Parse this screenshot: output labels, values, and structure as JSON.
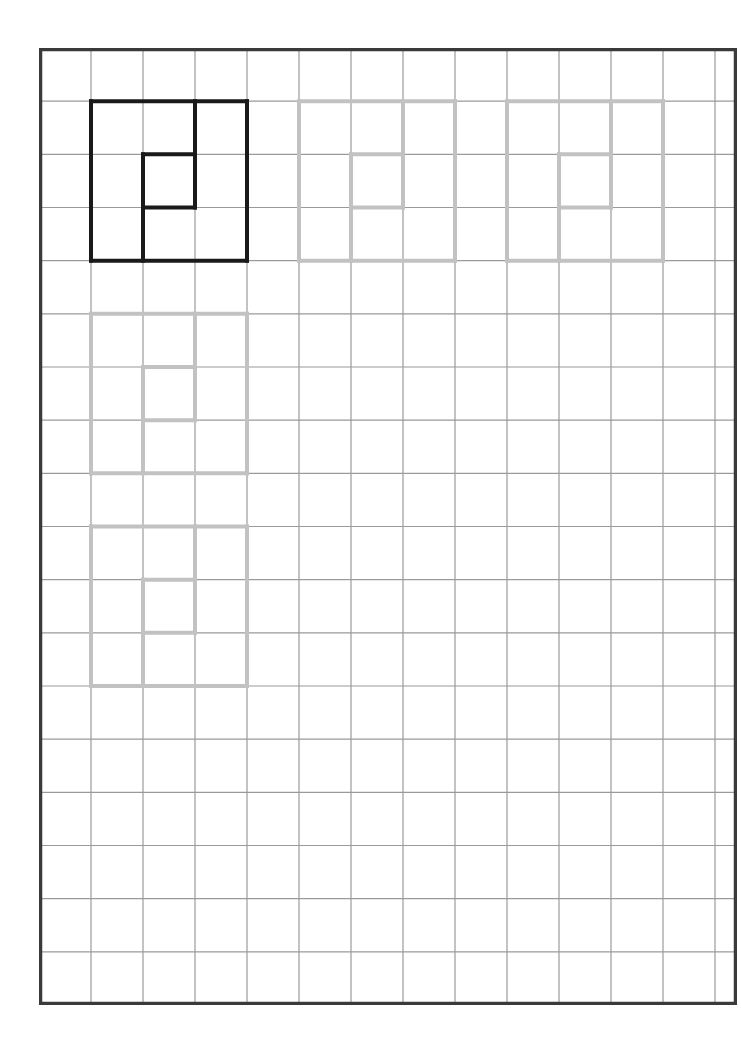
{
  "worksheet": {
    "type": "copy-the-pattern grid exercise",
    "grid": {
      "columns": 14,
      "rows": 18,
      "cell_width": 52,
      "cell_height": 53,
      "line_color": "#9a9a9a",
      "border_color": "#3a3a3a"
    },
    "pattern_segments": [
      {
        "from": [
          0,
          0
        ],
        "to": [
          3,
          0
        ]
      },
      {
        "from": [
          3,
          0
        ],
        "to": [
          3,
          3
        ]
      },
      {
        "from": [
          3,
          3
        ],
        "to": [
          0,
          3
        ]
      },
      {
        "from": [
          0,
          3
        ],
        "to": [
          0,
          0
        ]
      },
      {
        "from": [
          2,
          0
        ],
        "to": [
          2,
          2
        ]
      },
      {
        "from": [
          1,
          1
        ],
        "to": [
          2,
          1
        ]
      },
      {
        "from": [
          1,
          2
        ],
        "to": [
          2,
          2
        ]
      },
      {
        "from": [
          1,
          1
        ],
        "to": [
          1,
          3
        ]
      }
    ],
    "shapes": [
      {
        "name": "example-pattern",
        "col": 1,
        "row": 1,
        "color": "#1a1a1a",
        "width": 4
      },
      {
        "name": "trace-pattern-1",
        "col": 5,
        "row": 1,
        "color": "#c2c2c2",
        "width": 4
      },
      {
        "name": "trace-pattern-2",
        "col": 9,
        "row": 1,
        "color": "#c2c2c2",
        "width": 4
      },
      {
        "name": "trace-pattern-3",
        "col": 1,
        "row": 5,
        "color": "#c2c2c2",
        "width": 4
      },
      {
        "name": "trace-pattern-4",
        "col": 1,
        "row": 9,
        "color": "#c2c2c2",
        "width": 4
      }
    ]
  }
}
